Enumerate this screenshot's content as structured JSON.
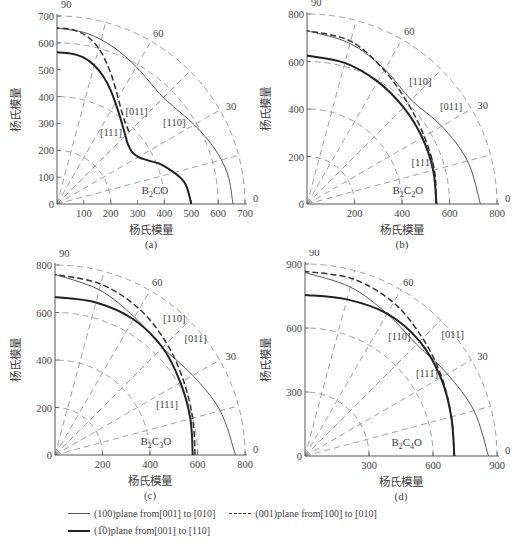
{
  "chart_data": [
    {
      "type": "line",
      "subtype": "polar-quadrant",
      "panel": "(a)",
      "compound": "B2CO",
      "compound_display": {
        "base": "B",
        "sub1": "2",
        "mid": "CO",
        "sub2": ""
      },
      "xlabel": "杨氏模量",
      "ylabel": "杨氏模量",
      "max": 700,
      "ticks": [
        0,
        100,
        200,
        300,
        400,
        500,
        600,
        700
      ],
      "x_tick_labels": [
        "100",
        "200",
        "300",
        "400",
        "500",
        "600",
        "700"
      ],
      "y_tick_labels": [
        "0",
        "100",
        "200",
        "300",
        "400",
        "500",
        "600",
        "700"
      ],
      "angle_labels": [
        "90",
        "60",
        "30",
        "0"
      ],
      "grid_arcs": [
        200,
        400,
        600,
        700
      ],
      "grid_angles": [
        15,
        30,
        45,
        60,
        75
      ],
      "series": [
        {
          "name": "(100)plane from[001] to [010]",
          "style": "thin",
          "angles": [
            0,
            10,
            20,
            30,
            40,
            45,
            50,
            60,
            70,
            80,
            90
          ],
          "values": [
            655,
            645,
            620,
            590,
            565,
            560,
            565,
            590,
            620,
            645,
            655
          ]
        },
        {
          "name": "(001)plane from[100] to [010]",
          "style": "dashed",
          "angles": [
            45,
            50,
            55,
            60,
            65,
            70,
            75,
            80,
            85,
            90
          ],
          "values": [
            380,
            395,
            420,
            455,
            500,
            550,
            600,
            635,
            652,
            655
          ]
        },
        {
          "name": "(1-10)plane from[001] to [110]",
          "style": "thick",
          "angles": [
            0,
            10,
            20,
            25,
            30,
            35,
            40,
            45,
            50,
            55,
            60,
            65,
            70,
            75,
            80,
            85,
            90
          ],
          "values": [
            500,
            480,
            420,
            380,
            350,
            340,
            345,
            360,
            380,
            405,
            435,
            470,
            505,
            535,
            555,
            563,
            565
          ]
        }
      ],
      "annotations": [
        {
          "text": "[011]",
          "x": 255,
          "y": 330
        },
        {
          "text": "[111]",
          "x": 160,
          "y": 255
        },
        {
          "text": "[110]",
          "x": 395,
          "y": 290
        }
      ]
    },
    {
      "type": "line",
      "subtype": "polar-quadrant",
      "panel": "(b)",
      "compound": "B2C2O",
      "compound_display": {
        "base": "B",
        "sub1": "2",
        "mid": "C",
        "sub2": "2",
        "end": "O"
      },
      "xlabel": "杨氏模量",
      "ylabel": "杨氏模量",
      "max": 800,
      "ticks": [
        0,
        200,
        400,
        600,
        800
      ],
      "x_tick_labels": [
        "200",
        "400",
        "600",
        "800"
      ],
      "y_tick_labels": [
        "0",
        "200",
        "400",
        "600",
        "800"
      ],
      "angle_labels": [
        "90",
        "60",
        "30",
        "0"
      ],
      "grid_arcs": [
        200,
        400,
        600,
        800
      ],
      "grid_angles": [
        15,
        30,
        45,
        60,
        75
      ],
      "series": [
        {
          "name": "(100)plane from[001] to [010]",
          "style": "thin",
          "angles": [
            0,
            15,
            30,
            45,
            60,
            75,
            90
          ],
          "values": [
            730,
            700,
            655,
            620,
            655,
            700,
            730
          ]
        },
        {
          "name": "(001)plane from[100] to [010]",
          "style": "dashed",
          "angles": [
            0,
            15,
            30,
            45,
            60,
            75,
            90
          ],
          "values": [
            545,
            555,
            570,
            600,
            650,
            710,
            730
          ]
        },
        {
          "name": "(1-10)plane from[001] to [110]",
          "style": "thick",
          "angles": [
            0,
            15,
            30,
            45,
            60,
            75,
            90
          ],
          "values": [
            545,
            550,
            560,
            575,
            595,
            615,
            625
          ]
        }
      ],
      "annotations": [
        {
          "text": "[110]",
          "x": 430,
          "y": 500
        },
        {
          "text": "[011]",
          "x": 560,
          "y": 395
        },
        {
          "text": "[111]",
          "x": 440,
          "y": 160
        }
      ]
    },
    {
      "type": "line",
      "subtype": "polar-quadrant",
      "panel": "(c)",
      "compound": "B2C3O",
      "compound_display": {
        "base": "B",
        "sub1": "2",
        "mid": "C",
        "sub2": "3",
        "end": "O"
      },
      "xlabel": "杨氏模量",
      "ylabel": "杨氏模量",
      "max": 800,
      "ticks": [
        0,
        200,
        400,
        600,
        800
      ],
      "x_tick_labels": [
        "200",
        "400",
        "600",
        "800"
      ],
      "y_tick_labels": [
        "0",
        "200",
        "400",
        "600",
        "800"
      ],
      "angle_labels": [
        "90",
        "60",
        "30",
        "0"
      ],
      "grid_arcs": [
        200,
        400,
        600,
        800
      ],
      "grid_angles": [
        15,
        30,
        45,
        60,
        75
      ],
      "series": [
        {
          "name": "(100)plane from[001] to [010]",
          "style": "thin",
          "angles": [
            0,
            15,
            30,
            45,
            60,
            75,
            90
          ],
          "values": [
            760,
            720,
            670,
            640,
            670,
            720,
            760
          ]
        },
        {
          "name": "(001)plane from[100] to [010]",
          "style": "dashed",
          "angles": [
            0,
            15,
            30,
            45,
            60,
            75,
            90
          ],
          "values": [
            590,
            600,
            625,
            665,
            710,
            745,
            760
          ]
        },
        {
          "name": "(1-10)plane from[001] to [110]",
          "style": "thick",
          "angles": [
            0,
            15,
            30,
            45,
            60,
            75,
            90
          ],
          "values": [
            580,
            590,
            610,
            640,
            660,
            665,
            665
          ]
        }
      ],
      "annotations": [
        {
          "text": "[110]",
          "x": 455,
          "y": 560
        },
        {
          "text": "[011]",
          "x": 545,
          "y": 475
        },
        {
          "text": "[111]",
          "x": 425,
          "y": 200
        }
      ]
    },
    {
      "type": "line",
      "subtype": "polar-quadrant",
      "panel": "(d)",
      "compound": "B2C4O",
      "compound_display": {
        "base": "B",
        "sub1": "2",
        "mid": "C",
        "sub2": "4",
        "end": "O"
      },
      "xlabel": "杨氏模量",
      "ylabel": "杨氏模量",
      "max": 900,
      "ticks": [
        0,
        300,
        600,
        900
      ],
      "x_tick_labels": [
        "300",
        "600",
        "900"
      ],
      "y_tick_labels": [
        "0",
        "300",
        "600",
        "900"
      ],
      "angle_labels": [
        "90",
        "60",
        "30",
        "0"
      ],
      "grid_arcs": [
        300,
        600,
        900
      ],
      "grid_angles": [
        15,
        30,
        45,
        60,
        75
      ],
      "series": [
        {
          "name": "(100)plane from[001] to [010]",
          "style": "thin",
          "angles": [
            0,
            15,
            30,
            45,
            60,
            75,
            90
          ],
          "values": [
            860,
            820,
            770,
            740,
            770,
            820,
            860
          ]
        },
        {
          "name": "(001)plane from[100] to [010]",
          "style": "dashed",
          "angles": [
            0,
            15,
            30,
            45,
            60,
            75,
            90
          ],
          "values": [
            700,
            710,
            740,
            780,
            830,
            860,
            865
          ]
        },
        {
          "name": "(1-10)plane from[001] to [110]",
          "style": "thick",
          "angles": [
            0,
            15,
            30,
            45,
            60,
            75,
            90
          ],
          "values": [
            700,
            710,
            735,
            760,
            770,
            760,
            755
          ]
        }
      ],
      "annotations": [
        {
          "text": "[110]",
          "x": 390,
          "y": 545
        },
        {
          "text": "[011]",
          "x": 640,
          "y": 555
        },
        {
          "text": "[111]",
          "x": 520,
          "y": 370
        }
      ]
    }
  ],
  "legend": {
    "items": [
      {
        "label": "(100)plane from[001] to [010]",
        "style": "thin"
      },
      {
        "label": "(001)plane from[100] to [010]",
        "style": "dashed"
      },
      {
        "label": "(1̅0)plane from[001] to [110]",
        "style": "thick"
      }
    ]
  }
}
